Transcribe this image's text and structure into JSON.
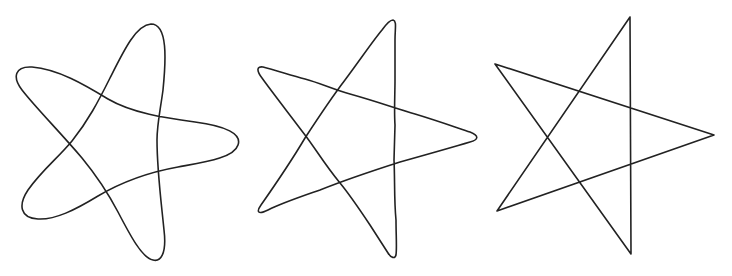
{
  "canvas": {
    "width": 732,
    "height": 276,
    "background": "#ffffff"
  },
  "stroke": {
    "color": "#222222",
    "width": 1.6
  },
  "stars": [
    {
      "name": "rounded-star",
      "style": "smooth-curved",
      "vertices": {
        "top": [
          151,
          24
        ],
        "left": [
          17,
          72
        ],
        "right": [
          238,
          140
        ],
        "bottom_left": [
          22,
          210
        ],
        "bottom": [
          155,
          260
        ]
      },
      "path": "M151,24 C168,24 166,60 163,90 C160,112 157,125 157,140 C157,170 161,200 164,230 C167,255 160,262 153,260 C142,258 130,235 118,212 C108,193 96,175 82,158 C60,132 36,108 22,90 C12,77 15,66 32,67 C58,69 85,85 108,99 C132,113 165,118 195,122 C226,126 242,134 238,145 C234,158 205,162 178,167 C150,172 120,183 98,196 C75,210 55,220 38,219 C20,218 18,205 28,190 C42,170 58,158 72,141 C88,121 98,102 110,78 C124,50 136,25 151,24 Z"
    },
    {
      "name": "hand-drawn-star",
      "style": "hand-drawn",
      "vertices": {
        "top": [
          393,
          20
        ],
        "left": [
          258,
          68
        ],
        "right": [
          477,
          137
        ],
        "bottom_left": [
          259,
          213
        ],
        "bottom": [
          394,
          257
        ]
      },
      "path": "M393,20 C397,21 395,28 395,40 L395,80 C395,95 394,110 395,125 L394,160 C395,180 394,200 396,220 C396,235 397,248 396,255 C395,259 391,258 388,253 L370,225 C360,210 350,195 340,183 C325,165 315,148 305,135 C290,115 272,92 262,78 C256,70 257,66 263,67 C275,70 290,75 305,79 C320,83 335,90 350,94 C375,101 395,108 415,114 C435,120 455,127 470,132 C480,136 478,140 470,142 C450,148 425,155 400,162 C375,170 345,180 320,190 C300,197 282,203 268,210 C258,215 256,212 261,205 C275,185 292,160 305,138 C320,115 332,97 345,80 C360,60 372,42 382,30 C387,23 390,20 393,20 Z"
    },
    {
      "name": "straight-star",
      "style": "straight-lines",
      "vertices": {
        "top": [
          630,
          17
        ],
        "left": [
          495,
          64
        ],
        "right": [
          714,
          135
        ],
        "bottom_left": [
          497,
          211
        ],
        "bottom": [
          631,
          254
        ]
      },
      "path": "M630,17 L631,254 L495,64 L714,135 L497,211 Z"
    }
  ]
}
